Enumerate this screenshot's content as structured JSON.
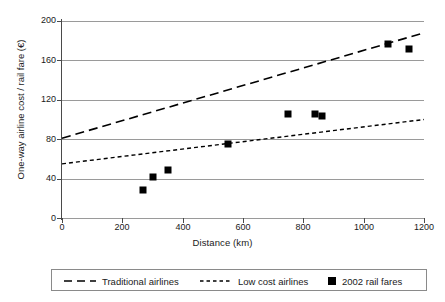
{
  "chart_data": {
    "type": "scatter",
    "title": "",
    "xlabel": "Distance (km)",
    "ylabel": "One-way airline cost / rail fare (€)",
    "xlim": [
      0,
      1200
    ],
    "ylim": [
      0,
      200
    ],
    "xticks": [
      0,
      200,
      400,
      600,
      800,
      1000,
      1200
    ],
    "yticks": [
      0,
      40,
      80,
      120,
      160,
      200
    ],
    "grid": "horizontal",
    "legend_position": "bottom",
    "series": [
      {
        "name": "Traditional airlines",
        "type": "line",
        "style": "long-dashed",
        "color": "#000000",
        "x": [
          0,
          1200
        ],
        "values": [
          81,
          188
        ]
      },
      {
        "name": "Low cost airlines",
        "type": "line",
        "style": "short-dashed",
        "color": "#000000",
        "x": [
          0,
          1200
        ],
        "values": [
          55,
          100
        ]
      },
      {
        "name": "2002 rail fares",
        "type": "scatter",
        "marker": "square",
        "color": "#000000",
        "points": [
          {
            "x": 270,
            "y": 28
          },
          {
            "x": 300,
            "y": 42
          },
          {
            "x": 350,
            "y": 49
          },
          {
            "x": 550,
            "y": 75
          },
          {
            "x": 750,
            "y": 106
          },
          {
            "x": 840,
            "y": 106
          },
          {
            "x": 862,
            "y": 104
          },
          {
            "x": 1080,
            "y": 177
          },
          {
            "x": 1150,
            "y": 172
          }
        ]
      }
    ]
  },
  "axis": {
    "x_tick_labels": [
      "0",
      "200",
      "400",
      "600",
      "800",
      "1000",
      "1200"
    ],
    "y_tick_labels": [
      "0",
      "40",
      "80",
      "120",
      "160",
      "200"
    ],
    "x_title": "Distance (km)",
    "y_title": "One-way airline cost / rail fare (€)"
  },
  "legend": {
    "items": [
      {
        "label": "Traditional airlines",
        "swatch": "long-dash-line-icon"
      },
      {
        "label": "Low cost airlines",
        "swatch": "short-dash-line-icon"
      },
      {
        "label": "2002 rail fares",
        "swatch": "black-square-marker-icon"
      }
    ]
  }
}
